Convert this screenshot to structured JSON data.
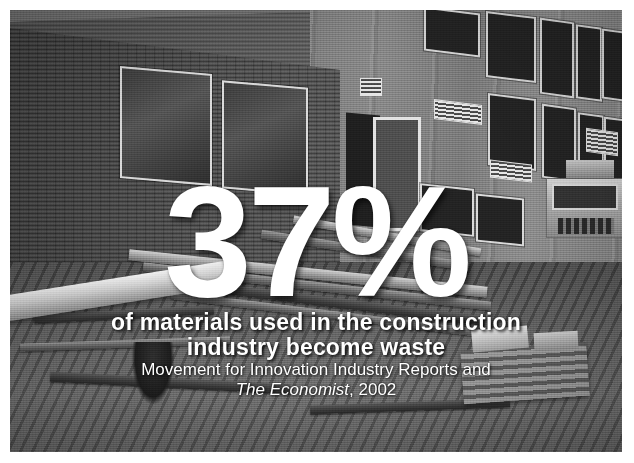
{
  "slide": {
    "kind": "photo-statistic-slide",
    "frame_color": "#ffffff",
    "photo": {
      "description": "black-and-white photograph of a brick and concrete building facade with a construction site in the foreground containing timber planks, scaffold boards, a white pipe, rubble and a parked lorry",
      "treatment": "grayscale",
      "dominant_color": "#5b5b5b"
    }
  },
  "headline": {
    "value": "37%",
    "color": "#ffffff"
  },
  "caption": {
    "line1": "of materials used in the construction",
    "line2": "industry become waste",
    "color": "#ffffff"
  },
  "source": {
    "line1": "Movement for Innovation Industry Reports and",
    "publication": "The Economist",
    "year": ", 2002"
  },
  "scene": {
    "elements": [
      "brick-wall-left",
      "brick-wall-upper",
      "concrete-facade-right",
      "window",
      "louver-vent",
      "doorway",
      "timber-planks",
      "white-pipe",
      "lorry",
      "pallet-stack",
      "rubble-ground"
    ]
  }
}
